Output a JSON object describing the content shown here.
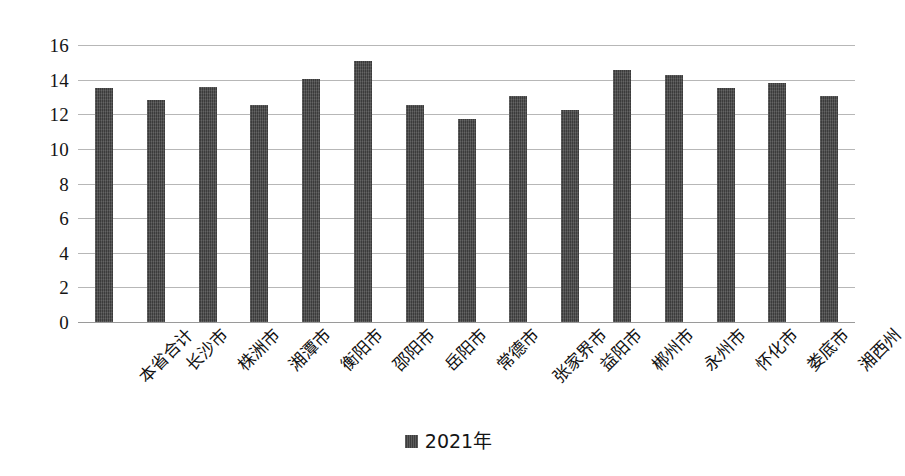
{
  "chart_data": {
    "type": "bar",
    "title": "",
    "subtitle": "",
    "xlabel": "",
    "ylabel": "",
    "ylim": [
      0,
      16
    ],
    "ytick_step": 2,
    "yticks": [
      "16",
      "14",
      "12",
      "10",
      "8",
      "6",
      "4",
      "2",
      "0"
    ],
    "grid": true,
    "legend_position": "bottom-center",
    "legend": [
      "2021年"
    ],
    "series_name": "2021年",
    "bar_color": "#474747",
    "gridline_color": "#b7b7b7",
    "categories": [
      "本省合计",
      "长沙市",
      "株洲市",
      "湘潭市",
      "衡阳市",
      "邵阳市",
      "岳阳市",
      "常德市",
      "张家界市",
      "益阳市",
      "郴州市",
      "永州市",
      "怀化市",
      "娄底市",
      "湘西州"
    ],
    "values": [
      13.5,
      12.85,
      13.6,
      12.55,
      14.05,
      15.1,
      12.55,
      11.75,
      13.05,
      12.25,
      14.55,
      14.25,
      13.5,
      13.8,
      13.05
    ],
    "series": [
      {
        "name": "2021年",
        "values": [
          13.5,
          12.85,
          13.6,
          12.55,
          14.05,
          15.1,
          12.55,
          11.75,
          13.05,
          12.25,
          14.55,
          14.25,
          13.5,
          13.8,
          13.05
        ]
      }
    ]
  }
}
